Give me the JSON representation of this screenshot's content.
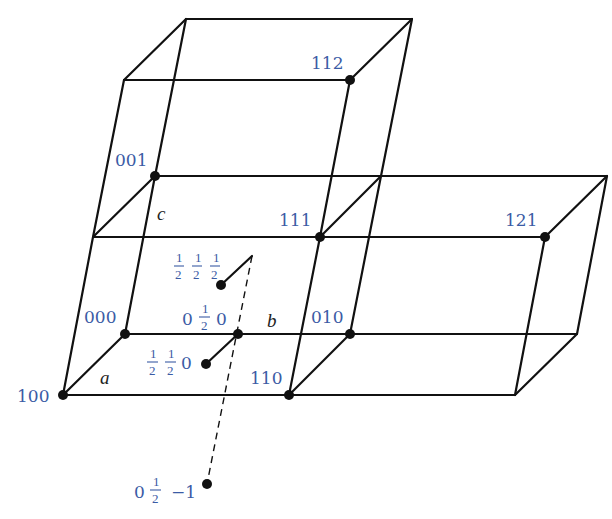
{
  "diagram": {
    "type": "crystal-lattice-unit-cells",
    "colors": {
      "edge": "#111111",
      "label": "#3b5ba5",
      "axis_label": "#222222"
    },
    "axis_labels": {
      "a": "a",
      "b": "b",
      "c": "c"
    },
    "lattice_points": [
      {
        "id": "000",
        "label": "000"
      },
      {
        "id": "100",
        "label": "100"
      },
      {
        "id": "010",
        "label": "010"
      },
      {
        "id": "001",
        "label": "001"
      },
      {
        "id": "110",
        "label": "110"
      },
      {
        "id": "111",
        "label": "111"
      },
      {
        "id": "112",
        "label": "112"
      },
      {
        "id": "121",
        "label": "121"
      }
    ],
    "fractional_points": {
      "p_half_half_half": {
        "parts": [
          "1/2",
          "1/2",
          "1/2"
        ],
        "n1": "1",
        "d1": "2",
        "n2": "1",
        "d2": "2",
        "n3": "1",
        "d3": "2"
      },
      "p_0_half_0": {
        "whole1": "0",
        "n": "1",
        "d": "2",
        "whole3": "0"
      },
      "p_half_half_0": {
        "n1": "1",
        "d1": "2",
        "n2": "1",
        "d2": "2",
        "whole3": "0"
      },
      "p_0_half_minus1": {
        "whole1": "0",
        "n": "1",
        "d": "2",
        "whole3": "−1"
      }
    },
    "cells": [
      {
        "name": "base-cell",
        "origin": "000"
      },
      {
        "name": "upper-cell",
        "origin": "001"
      },
      {
        "name": "right-cell",
        "origin": "010"
      }
    ]
  }
}
